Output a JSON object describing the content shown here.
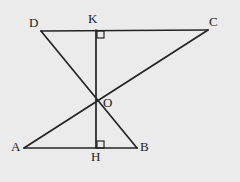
{
  "figure": {
    "background_color": "#ebebeb",
    "stroke_color": "#242424",
    "label_color": "#1d1d1d",
    "stroke_width": 1.7,
    "canvas": {
      "width": 240,
      "height": 182
    },
    "points": {
      "D": {
        "label": "D",
        "x": 41,
        "y": 31
      },
      "K": {
        "label": "K",
        "x": 96,
        "y": 30
      },
      "C": {
        "label": "C",
        "x": 208,
        "y": 30
      },
      "O": {
        "label": "O",
        "x": 96,
        "y": 101
      },
      "A": {
        "label": "A",
        "x": 24,
        "y": 148
      },
      "H": {
        "label": "H",
        "x": 96,
        "y": 148
      },
      "B": {
        "label": "B",
        "x": 137,
        "y": 148
      }
    },
    "segments": [
      {
        "name": "segment-DC",
        "from": "D",
        "to": "C",
        "x1": 41,
        "y1": 31,
        "x2": 208,
        "y2": 30
      },
      {
        "name": "segment-AB",
        "from": "A",
        "to": "B",
        "x1": 24,
        "y1": 148,
        "x2": 137,
        "y2": 148
      },
      {
        "name": "segment-KH",
        "from": "K",
        "to": "H",
        "x1": 96,
        "y1": 30,
        "x2": 96,
        "y2": 148
      },
      {
        "name": "segment-DB",
        "from": "D",
        "to": "B",
        "x1": 41,
        "y1": 31,
        "x2": 137,
        "y2": 148
      },
      {
        "name": "segment-AC",
        "from": "A",
        "to": "C",
        "x1": 24,
        "y1": 148,
        "x2": 208,
        "y2": 30
      }
    ],
    "right_angle_marks": [
      {
        "name": "right-angle-at-K",
        "vertex": "K",
        "x": 97,
        "y": 31,
        "size": 7,
        "orientation": "below-right"
      },
      {
        "name": "right-angle-at-H",
        "vertex": "H",
        "x": 97,
        "y": 141,
        "size": 7,
        "orientation": "above-right"
      }
    ]
  }
}
